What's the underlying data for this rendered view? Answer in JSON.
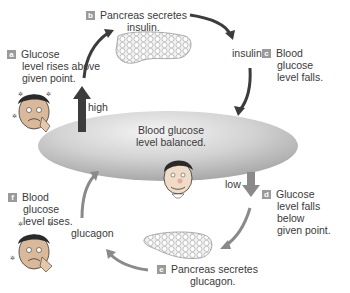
{
  "center": {
    "label_line1": "Blood glucose",
    "label_line2": "level balanced."
  },
  "steps": [
    {
      "id": "a",
      "lines": [
        "Glucose",
        "level rises above",
        "given point."
      ]
    },
    {
      "id": "b",
      "lines": [
        "Pancreas secretes",
        "insulin."
      ]
    },
    {
      "id": "c",
      "lines": [
        "Blood",
        "glucose",
        "level falls."
      ]
    },
    {
      "id": "d",
      "lines": [
        "Glucose",
        "level falls below",
        "given point."
      ]
    },
    {
      "id": "e",
      "lines": [
        "Pancreas secretes",
        "glucagon."
      ]
    },
    {
      "id": "f",
      "lines": [
        "Blood",
        "glucose",
        "level rises."
      ]
    }
  ],
  "arrow_labels": {
    "high": "high",
    "low": "low",
    "insulin": "insulin",
    "glucagon": "glucagon"
  },
  "colors": {
    "arrow_dark": "#3c3c3c",
    "arrow_light": "#8a8a8a",
    "ellipse": "#cfcfcf",
    "badge": "#9a9a9a"
  }
}
